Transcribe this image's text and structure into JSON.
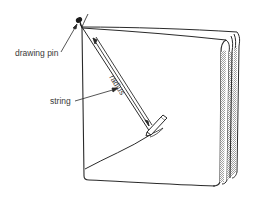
{
  "figure": {
    "type": "line-drawing",
    "labels": {
      "drawing_pin": "drawing pin",
      "string": "string",
      "radius": "radius"
    },
    "colors": {
      "line": "#2a2a2a",
      "label": "#3a3a3a",
      "hatch": "#9a9a9a",
      "background": "#ffffff"
    }
  }
}
